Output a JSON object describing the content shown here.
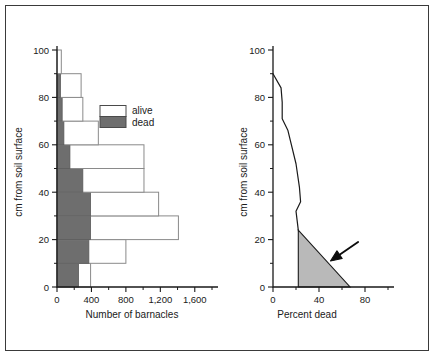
{
  "chart_data": [
    {
      "type": "bar",
      "id": "barnacle-counts",
      "orientation": "horizontal-stacked",
      "title": "",
      "xlabel": "Number of barnacles",
      "ylabel": "cm from soil surface",
      "xlim": [
        0,
        1800
      ],
      "ylim": [
        0,
        100
      ],
      "xticks": [
        0,
        400,
        800,
        1200,
        1600
      ],
      "xticklabels": [
        "0",
        "400",
        "800",
        "1,200",
        "1,600"
      ],
      "xminorticks": [
        200,
        600,
        1000,
        1400,
        1800
      ],
      "yticks": [
        0,
        20,
        40,
        60,
        80,
        100
      ],
      "yticklabels": [
        "0",
        "20",
        "40",
        "60",
        "80",
        "100"
      ],
      "yminorticks": [
        10,
        30,
        50,
        70,
        90
      ],
      "grid": false,
      "band_height": 10,
      "categories": [
        "0-10",
        "10-20",
        "20-30",
        "30-40",
        "40-50",
        "50-60",
        "60-70",
        "70-80",
        "80-90",
        "90-100"
      ],
      "series": [
        {
          "name": "dead",
          "color": "#6e6e6e",
          "values": [
            250,
            370,
            390,
            390,
            300,
            150,
            80,
            60,
            40,
            0
          ]
        },
        {
          "name": "alive",
          "color": "#ffffff",
          "values": [
            140,
            430,
            1020,
            790,
            710,
            860,
            400,
            240,
            240,
            50
          ]
        }
      ],
      "legend": {
        "position": "upper-center-right",
        "entries": [
          {
            "label": "alive",
            "color": "#ffffff"
          },
          {
            "label": "dead",
            "color": "#6e6e6e"
          }
        ]
      }
    },
    {
      "type": "line",
      "id": "percent-dead",
      "title": "",
      "xlabel": "Percent dead",
      "ylabel": "cm from soil surface",
      "xlim": [
        0,
        100
      ],
      "ylim": [
        0,
        100
      ],
      "xticks": [
        0,
        40,
        80
      ],
      "xticklabels": [
        "0",
        "40",
        "80"
      ],
      "xminorticks": [
        20,
        60,
        100
      ],
      "yticks": [
        0,
        20,
        40,
        60,
        80,
        100
      ],
      "yticklabels": [
        "0",
        "20",
        "40",
        "60",
        "80",
        "100"
      ],
      "yminorticks": [
        10,
        30,
        50,
        70,
        90
      ],
      "grid": false,
      "series": [
        {
          "name": "percent dead",
          "color": "#1a1a1a",
          "points": [
            {
              "x": 0,
              "y": 90
            },
            {
              "x": 7,
              "y": 84
            },
            {
              "x": 8,
              "y": 78
            },
            {
              "x": 8,
              "y": 71
            },
            {
              "x": 13,
              "y": 66
            },
            {
              "x": 15,
              "y": 62
            },
            {
              "x": 20,
              "y": 52
            },
            {
              "x": 23,
              "y": 42
            },
            {
              "x": 24,
              "y": 36
            },
            {
              "x": 20,
              "y": 32
            },
            {
              "x": 21,
              "y": 28
            },
            {
              "x": 22,
              "y": 24
            }
          ]
        }
      ],
      "annotations": [
        {
          "name": "shaded-wedge",
          "kind": "filled-triangle",
          "color": "#b9b9b9",
          "vertices": [
            {
              "x": 22,
              "y": 24
            },
            {
              "x": 22,
              "y": 0
            },
            {
              "x": 67,
              "y": 0
            }
          ]
        },
        {
          "name": "pointer-arrow",
          "kind": "arrow",
          "color": "#0d0d0d",
          "tail": {
            "x": 74,
            "y": 19
          },
          "head": {
            "x": 50,
            "y": 11
          }
        }
      ]
    }
  ],
  "left_chart": {
    "xlabel": "Number of barnacles",
    "ylabel": "cm from soil surface",
    "xticklabels": [
      "0",
      "400",
      "800",
      "1,200",
      "1,600"
    ],
    "yticklabels": [
      "0",
      "20",
      "40",
      "60",
      "80",
      "100"
    ],
    "legend": {
      "alive": "alive",
      "dead": "dead"
    }
  },
  "right_chart": {
    "xlabel": "Percent dead",
    "ylabel": "cm from soil surface",
    "xticklabels": [
      "0",
      "40",
      "80"
    ],
    "yticklabels": [
      "0",
      "20",
      "40",
      "60",
      "80",
      "100"
    ]
  }
}
